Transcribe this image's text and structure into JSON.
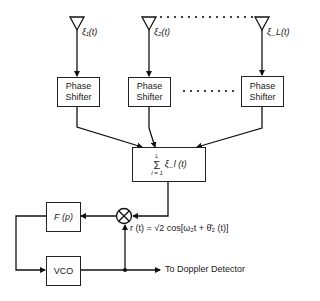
{
  "diagram": {
    "type": "block-diagram",
    "antennas": [
      {
        "id": "antenna-1",
        "label": "ξ₁(t)"
      },
      {
        "id": "antenna-2",
        "label": "ξ₂(t)"
      },
      {
        "id": "antenna-L",
        "label": "ξ_L(t)"
      }
    ],
    "phase_shifters": [
      {
        "id": "phase-shifter-1",
        "line1": "Phase",
        "line2": "Shifter"
      },
      {
        "id": "phase-shifter-2",
        "line1": "Phase",
        "line2": "Shifter"
      },
      {
        "id": "phase-shifter-L",
        "line1": "Phase",
        "line2": "Shifter"
      }
    ],
    "summer": {
      "upper_limit": "L",
      "sigma": "Σ",
      "lower_limit": "l = 1",
      "term": "ξ_l (t)"
    },
    "loop_filter": {
      "label": "F (p)"
    },
    "vco": {
      "label": "VCO"
    },
    "multiplier": {
      "symbol": "⊗"
    },
    "reference_signal": {
      "label": "r (t) = √2 cos[ω₂t + θ̂₂ (t)]"
    },
    "output": {
      "label": "To Doppler Detector"
    }
  }
}
